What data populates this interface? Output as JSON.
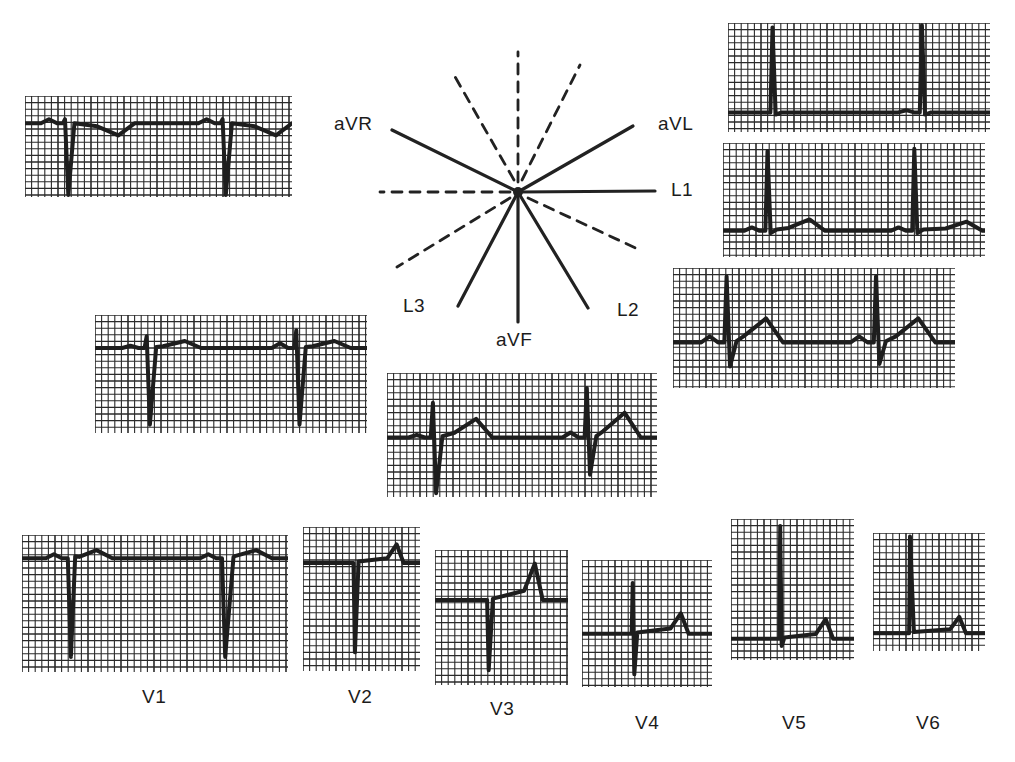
{
  "figure": {
    "title": "",
    "ink_color": "#1e1e1e",
    "paper_color": "#ffffff",
    "grid": {
      "minor_px": 6.6,
      "major_every": 5
    }
  },
  "hexaxial": {
    "center": [
      518,
      192
    ],
    "leads": [
      {
        "name": "aVR",
        "label": "aVR",
        "angle_deg": -150,
        "style": "solid"
      },
      {
        "name": "aVL",
        "label": "aVL",
        "angle_deg": -30,
        "style": "solid"
      },
      {
        "name": "L1",
        "label": "L1",
        "angle_deg": 0,
        "style": "solid"
      },
      {
        "name": "L2",
        "label": "L2",
        "angle_deg": 60,
        "style": "solid"
      },
      {
        "name": "aVF",
        "label": "aVF",
        "angle_deg": 90,
        "style": "solid"
      },
      {
        "name": "L3",
        "label": "L3",
        "angle_deg": 120,
        "style": "solid"
      },
      {
        "name": "neg-L1",
        "angle_deg": 180,
        "style": "dashed"
      },
      {
        "name": "neg-aVF",
        "angle_deg": -90,
        "style": "dashed"
      },
      {
        "name": "neg-L2",
        "angle_deg": -120,
        "style": "dashed"
      },
      {
        "name": "neg-L3",
        "angle_deg": -60,
        "style": "dashed"
      },
      {
        "name": "neg-aVL",
        "angle_deg": 150,
        "style": "dashed"
      },
      {
        "name": "neg-aVR",
        "angle_deg": 30,
        "style": "dashed"
      }
    ]
  },
  "labels": {
    "aVR": "aVR",
    "aVL": "aVL",
    "L1": "L1",
    "L2": "L2",
    "L3": "L3",
    "aVF": "aVF",
    "V1": "V1",
    "V2": "V2",
    "V3": "V3",
    "V4": "V4",
    "V5": "V5",
    "V6": "V6"
  },
  "strips": [
    {
      "id": "aVR",
      "box": [
        25,
        96,
        267,
        101
      ],
      "baseline": 0.27,
      "beats": [
        {
          "x": 0.15,
          "q": 0,
          "r": 0.04,
          "s": 0.95,
          "t": -0.12,
          "tx": 0.35,
          "p": 0.04
        },
        {
          "x": 0.74,
          "q": 0,
          "r": 0.04,
          "s": 0.95,
          "t": -0.12,
          "tx": 0.94,
          "p": 0.04
        }
      ]
    },
    {
      "id": "aVL",
      "box": [
        728,
        23,
        262,
        109
      ],
      "baseline": 0.82,
      "beats": [
        {
          "x": 0.17,
          "q": 0,
          "r": 0.78,
          "s": 0.02,
          "t": 0.0,
          "tx": 0.4,
          "p": 0.0
        },
        {
          "x": 0.74,
          "q": 0,
          "r": 0.8,
          "s": 0.02,
          "t": 0.0,
          "tx": 0.9,
          "p": 0.02
        }
      ]
    },
    {
      "id": "L1",
      "box": [
        723,
        143,
        262,
        114
      ],
      "baseline": 0.77,
      "beats": [
        {
          "x": 0.17,
          "q": 0,
          "r": 0.7,
          "s": 0.02,
          "t": 0.1,
          "tx": 0.33,
          "p": 0.03
        },
        {
          "x": 0.73,
          "q": 0,
          "r": 0.72,
          "s": 0.02,
          "t": 0.08,
          "tx": 0.93,
          "p": 0.03
        }
      ]
    },
    {
      "id": "L2",
      "box": [
        673,
        268,
        282,
        120
      ],
      "baseline": 0.62,
      "beats": [
        {
          "x": 0.19,
          "q": 0,
          "r": 0.55,
          "s": 0.2,
          "t": 0.2,
          "tx": 0.33,
          "p": 0.05
        },
        {
          "x": 0.72,
          "q": 0,
          "r": 0.55,
          "s": 0.18,
          "t": 0.2,
          "tx": 0.87,
          "p": 0.05
        }
      ]
    },
    {
      "id": "L3",
      "box": [
        95,
        315,
        272,
        118
      ],
      "baseline": 0.28,
      "beats": [
        {
          "x": 0.19,
          "q": 0,
          "r": 0.1,
          "s": 0.65,
          "t": 0.06,
          "tx": 0.33,
          "p": 0.02
        },
        {
          "x": 0.74,
          "q": 0,
          "r": 0.15,
          "s": 0.65,
          "t": 0.06,
          "tx": 0.88,
          "p": 0.04
        }
      ]
    },
    {
      "id": "aVF",
      "box": [
        387,
        373,
        270,
        124
      ],
      "baseline": 0.52,
      "beats": [
        {
          "x": 0.17,
          "q": 0,
          "r": 0.28,
          "s": 0.45,
          "t": 0.15,
          "tx": 0.33,
          "p": 0.02
        },
        {
          "x": 0.74,
          "q": 0,
          "r": 0.4,
          "s": 0.3,
          "t": 0.2,
          "tx": 0.88,
          "p": 0.04
        }
      ]
    },
    {
      "id": "V1",
      "box": [
        22,
        535,
        266,
        137
      ],
      "baseline": 0.17,
      "beats": [
        {
          "x": 0.18,
          "q": 0,
          "r": 0.0,
          "s": 0.72,
          "t": 0.06,
          "tx": 0.28,
          "p": 0.03
        },
        {
          "x": 0.76,
          "q": 0,
          "r": 0.0,
          "s": 0.72,
          "t": 0.06,
          "tx": 0.88,
          "p": 0.03
        }
      ]
    },
    {
      "id": "V2",
      "box": [
        303,
        527,
        117,
        144
      ],
      "baseline": 0.25,
      "beats": [
        {
          "x": 0.44,
          "q": 0,
          "r": 0.0,
          "s": 0.62,
          "t": 0.13,
          "tx": 0.8,
          "p": 0.0
        }
      ]
    },
    {
      "id": "V3",
      "box": [
        435,
        550,
        133,
        135
      ],
      "baseline": 0.37,
      "beats": [
        {
          "x": 0.4,
          "q": 0,
          "r": 0.0,
          "s": 0.52,
          "t": 0.27,
          "tx": 0.75,
          "p": 0.0
        }
      ]
    },
    {
      "id": "V4",
      "box": [
        582,
        560,
        130,
        127
      ],
      "baseline": 0.58,
      "beats": [
        {
          "x": 0.39,
          "q": 0,
          "r": 0.4,
          "s": 0.32,
          "t": 0.16,
          "tx": 0.76,
          "p": 0.0
        }
      ]
    },
    {
      "id": "V5",
      "box": [
        731,
        519,
        123,
        141
      ],
      "baseline": 0.85,
      "beats": [
        {
          "x": 0.4,
          "q": 0,
          "r": 0.8,
          "s": 0.05,
          "t": 0.14,
          "tx": 0.77,
          "p": 0.0
        }
      ]
    },
    {
      "id": "V6",
      "box": [
        873,
        533,
        112,
        118
      ],
      "baseline": 0.85,
      "beats": [
        {
          "x": 0.33,
          "q": 0,
          "r": 0.82,
          "s": 0.0,
          "t": 0.14,
          "tx": 0.77,
          "p": 0.0
        }
      ]
    }
  ]
}
